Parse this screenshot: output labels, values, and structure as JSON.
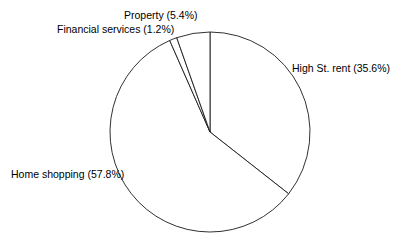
{
  "chart": {
    "background_color": "#ffffff",
    "line_color": "#1a1a1a",
    "slice_fill_color": "#ffffff",
    "center_x": 210,
    "center_y": 132,
    "radius": 100
  },
  "chart_data": {
    "type": "pie",
    "title": "",
    "subtitle": "",
    "xlabel": "",
    "ylabel": "",
    "legend_position": "none",
    "grid": false,
    "start_angle_deg": 0,
    "direction": "clockwise",
    "categories": [
      "High St. rent",
      "Home shopping",
      "Financial services",
      "Property"
    ],
    "values": [
      35.6,
      57.8,
      1.2,
      5.4
    ],
    "units": "percent",
    "labels": [
      "High St. rent (35.6%)",
      "Home shopping (57.8%)",
      "Financial services (1.2%)",
      "Property (5.4%)"
    ],
    "slices": [
      {
        "name": "High St. rent",
        "value": 35.6,
        "label": "High St. rent (35.6%)",
        "start_deg": 0,
        "end_deg": 128.16,
        "label_position": "right"
      },
      {
        "name": "Home shopping",
        "value": 57.8,
        "label": "Home shopping (57.8%)",
        "start_deg": 128.16,
        "end_deg": 336.24,
        "label_position": "left"
      },
      {
        "name": "Financial services",
        "value": 1.2,
        "label": "Financial services (1.2%)",
        "start_deg": 336.24,
        "end_deg": 340.56,
        "label_position": "top-left"
      },
      {
        "name": "Property",
        "value": 5.4,
        "label": "Property (5.4%)",
        "start_deg": 340.56,
        "end_deg": 360,
        "label_position": "top"
      }
    ]
  }
}
